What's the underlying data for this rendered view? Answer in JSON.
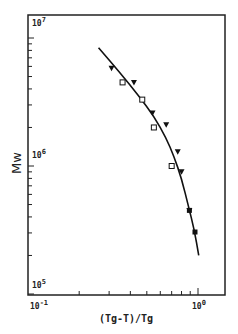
{
  "chart_data": {
    "type": "scatter",
    "title": "",
    "xlabel": "(Tg-T)/Tg",
    "ylabel": "Mw",
    "xscale": "log",
    "yscale": "log",
    "xlim": [
      0.1,
      1.3
    ],
    "ylim": [
      100000,
      12000000
    ],
    "x_tick_labels": [
      {
        "base": "10",
        "exp": "-1",
        "value": 0.1
      },
      {
        "base": "10",
        "exp": "0",
        "value": 1
      }
    ],
    "y_tick_labels": [
      {
        "base": "10",
        "exp": "7",
        "value": 10000000
      },
      {
        "base": "10",
        "exp": "6",
        "value": 1000000
      },
      {
        "base": "10",
        "exp": "5",
        "value": 100000
      }
    ],
    "grid": false,
    "legend": null,
    "series": [
      {
        "name": "triangles",
        "marker": "triangle-down",
        "points": [
          {
            "x": 0.31,
            "y": 5800000
          },
          {
            "x": 0.42,
            "y": 4500000
          },
          {
            "x": 0.54,
            "y": 2600000
          },
          {
            "x": 0.65,
            "y": 2100000
          },
          {
            "x": 0.76,
            "y": 1290000
          },
          {
            "x": 0.8,
            "y": 900000
          },
          {
            "x": 0.89,
            "y": 450000
          }
        ]
      },
      {
        "name": "squares",
        "marker": "square-open",
        "points": [
          {
            "x": 0.36,
            "y": 4500000
          },
          {
            "x": 0.47,
            "y": 3300000
          },
          {
            "x": 0.55,
            "y": 2000000
          },
          {
            "x": 0.7,
            "y": 1000000
          }
        ]
      },
      {
        "name": "filled squares",
        "marker": "square-filled",
        "points": [
          {
            "x": 0.89,
            "y": 450000
          },
          {
            "x": 0.96,
            "y": 305000
          }
        ]
      },
      {
        "name": "fit curve",
        "marker": "line",
        "points": [
          {
            "x": 0.26,
            "y": 8400000
          },
          {
            "x": 0.35,
            "y": 5300000
          },
          {
            "x": 0.45,
            "y": 3500000
          },
          {
            "x": 0.55,
            "y": 2450000
          },
          {
            "x": 0.65,
            "y": 1650000
          },
          {
            "x": 0.72,
            "y": 1200000
          },
          {
            "x": 0.8,
            "y": 800000
          },
          {
            "x": 0.88,
            "y": 480000
          },
          {
            "x": 0.95,
            "y": 320000
          },
          {
            "x": 1.01,
            "y": 200000
          }
        ]
      }
    ]
  }
}
